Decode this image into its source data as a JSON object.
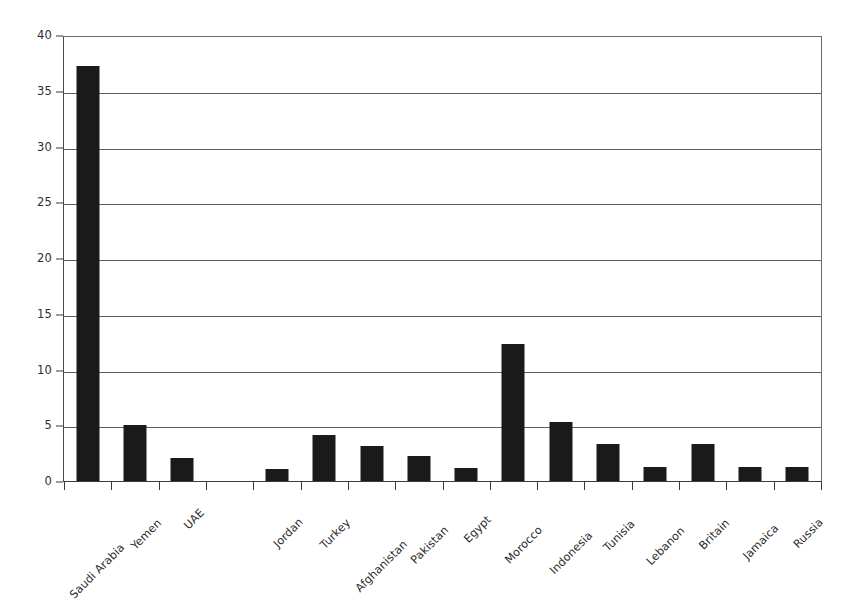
{
  "chart_data": {
    "type": "bar",
    "title": "",
    "subtitle": "",
    "xlabel": "",
    "ylabel": "",
    "ylim": [
      0,
      40
    ],
    "yticks": [
      0,
      5,
      10,
      15,
      20,
      25,
      30,
      35,
      40
    ],
    "ytick_labels": [
      "0",
      "5",
      "10",
      "15",
      "20",
      "25",
      "30",
      "35",
      "40"
    ],
    "grid": "horizontal",
    "legend": "none",
    "orientation": "vertical",
    "bar_color": "#1a1a1a",
    "categories": [
      "Saudi Arabia",
      "Yemen",
      "UAE",
      "",
      "Jordan",
      "Turkey",
      "Afghanistan",
      "Pakistan",
      "Egypt",
      "Morocco",
      "Indonesia",
      "Tunisia",
      "Lebanon",
      "Britain",
      "Jamaica",
      "Russia"
    ],
    "values": [
      37.2,
      5.0,
      2.1,
      0,
      1.1,
      4.1,
      3.1,
      2.2,
      1.2,
      12.3,
      5.3,
      3.3,
      1.3,
      3.3,
      1.3,
      1.3
    ],
    "series": [
      {
        "name": "count",
        "values": [
          37.2,
          5.0,
          2.1,
          0,
          1.1,
          4.1,
          3.1,
          2.2,
          1.2,
          12.3,
          5.3,
          3.3,
          1.3,
          3.3,
          1.3,
          1.3
        ]
      }
    ],
    "annotations": []
  },
  "axes": {
    "y_axis_color": "#3a3a3a",
    "grid_color": "#5e5e5e",
    "tick_label_color": "#2e2e2e"
  }
}
